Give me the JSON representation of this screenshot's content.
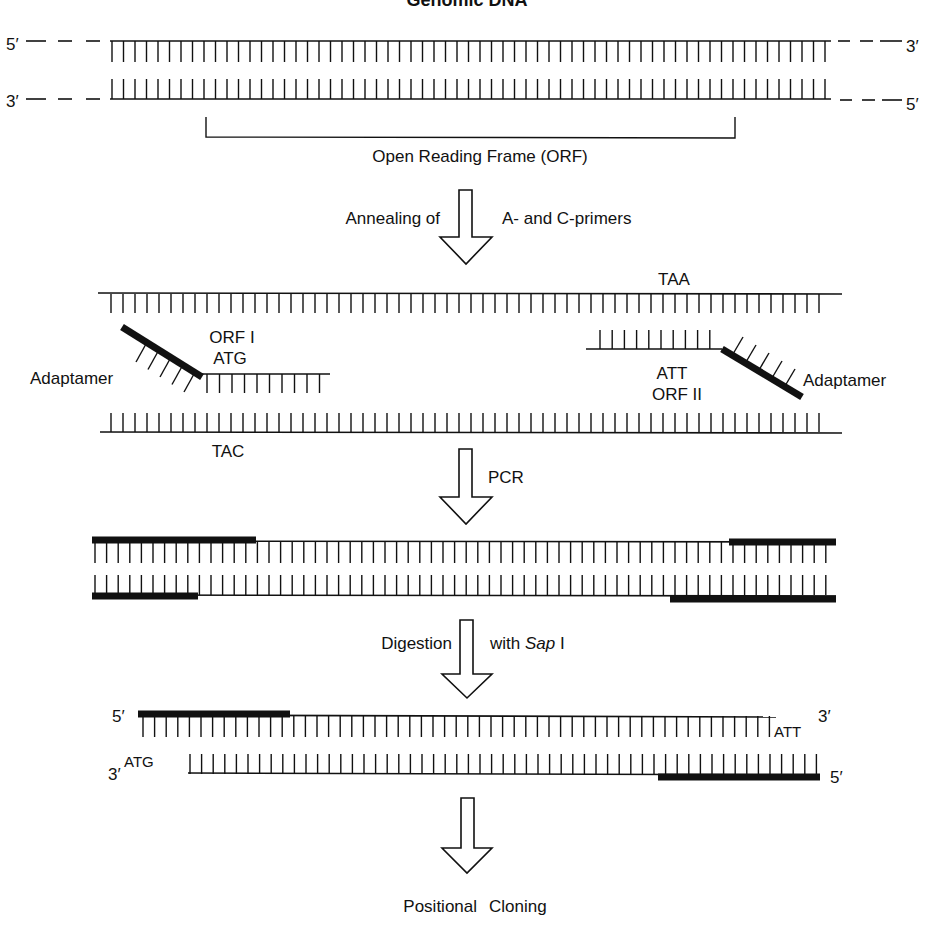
{
  "figure": {
    "title": "Genomic DNA",
    "colors": {
      "ink": "#111111",
      "background": "#ffffff"
    },
    "genomic": {
      "top_left_end": "5′",
      "top_right_end": "3′",
      "bottom_left_end": "3′",
      "bottom_right_end": "5′",
      "orf_label": "Open Reading Frame (ORF)"
    },
    "step1": {
      "label_left": "Annealing of",
      "label_right": "A- and C-primers",
      "top_codon": "TAA",
      "left_primer_label_line1": "ORF I",
      "left_primer_label_line2": "ATG",
      "left_adaptamer": "Adaptamer",
      "right_primer_label_line1": "ATT",
      "right_primer_label_line2": "ORF II",
      "right_adaptamer": "Adaptamer",
      "bottom_codon": "TAC"
    },
    "step2": {
      "label_right": "PCR"
    },
    "step3": {
      "label_left": "Digestion",
      "label_right_prefix": "with ",
      "label_right_enzyme": "Sap",
      "label_right_suffix": " I",
      "top_left_end": "5′",
      "top_right_codon": "ATT",
      "top_right_end": "3′",
      "bottom_left_end": "3′",
      "bottom_left_codon": "ATG",
      "bottom_right_end": "5′"
    },
    "final": {
      "label_word1": "Positional",
      "label_word2": "Cloning"
    },
    "icons": [
      "down-arrow-icon",
      "down-arrow-icon",
      "down-arrow-icon",
      "down-arrow-icon"
    ]
  }
}
